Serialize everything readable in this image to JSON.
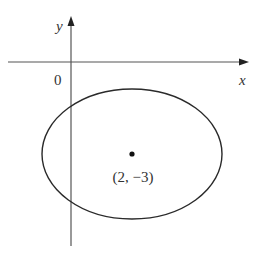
{
  "diagram": {
    "type": "coordinate-plane-ellipse",
    "axes": {
      "x_label": "x",
      "y_label": "y",
      "origin_label": "0"
    },
    "ellipse": {
      "center_label": "(2, −3)",
      "center": [
        2,
        -3
      ]
    },
    "colors": {
      "stroke": "#2a2a2a",
      "background": "#ffffff"
    }
  }
}
